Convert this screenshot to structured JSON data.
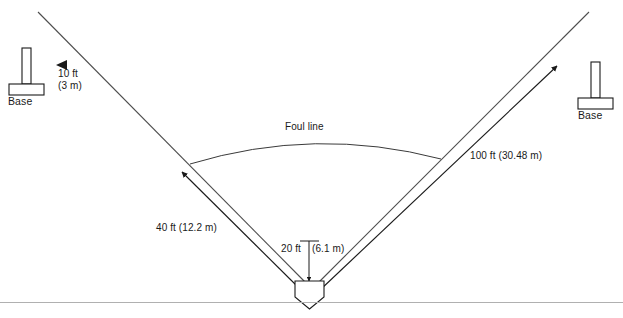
{
  "diagram": {
    "labels": {
      "base_left": "Base",
      "base_right": "Base",
      "ten_ft": "10 ft",
      "ten_m": "(3 m)",
      "foul_line": "Foul line",
      "hundred_ft": "100 ft (30.48 m)",
      "forty_ft": "40 ft (12.2 m)",
      "twenty_ft": "20 ft",
      "twenty_m": "(6.1 m)"
    },
    "colors": {
      "stroke": "#1a1a1a",
      "thin_stroke": "#5a5a5a",
      "fill": "#ffffff",
      "text": "#1a1a1a",
      "baseline": "#a8a8a8"
    },
    "measurements": {
      "foul_line_length_ft": 100,
      "foul_line_length_m": 30.48,
      "base_distance_ft": 40,
      "base_distance_m": 12.2,
      "plate_offset_ft": 20,
      "plate_offset_m": 6.1,
      "base_clearance_ft": 10,
      "base_clearance_m": 3
    },
    "icons": {
      "base_marker": "base-post-icon",
      "home_plate": "home-plate-icon",
      "arrowhead_left": "arrowhead-left-icon",
      "arrow_up_left": "arrow-up-left-icon",
      "arrow_up_right": "arrow-up-right-icon",
      "arrow_down": "arrow-down-icon"
    }
  }
}
